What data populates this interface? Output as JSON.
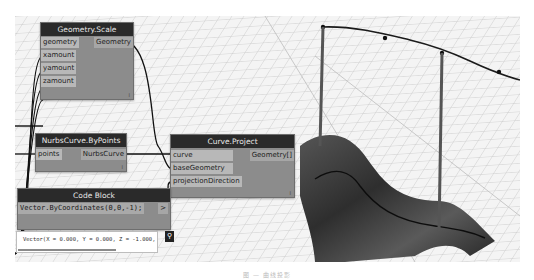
{
  "nodes": {
    "geometry_scale": {
      "title": "Geometry.Scale",
      "inputs": [
        "geometry",
        "xamount",
        "yamount",
        "zamount"
      ],
      "output": "Geometry",
      "lacing": "l"
    },
    "nurbs_curve": {
      "title": "NurbsCurve.ByPoints",
      "inputs": [
        "points"
      ],
      "output": "NurbsCurve",
      "lacing": "l"
    },
    "curve_project": {
      "title": "Curve.Project",
      "inputs": [
        "curve",
        "baseGeometry",
        "projectionDirection"
      ],
      "output": "Geometry[]",
      "lacing": "l"
    },
    "code_block": {
      "title": "Code Block",
      "code": "Vector.ByCoordinates(0,0,-1);",
      "output_arrow": ">",
      "preview": "Vector(X = 0.000, Y = 0.000, Z = -1.000,",
      "pin_icon": "pin-icon"
    }
  },
  "caption": "图 — 曲线投影",
  "colors": {
    "node_header": "#2a2a2a",
    "node_body": "#8c8c8c",
    "port": "#b8b8b8",
    "grid": "#c8c8c8",
    "surface": "#3a3a3a",
    "wire": "#111111"
  }
}
